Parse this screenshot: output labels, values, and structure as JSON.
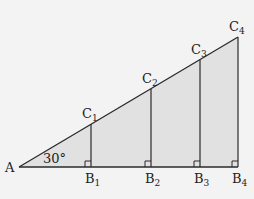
{
  "diagram": {
    "angle_label": "30°",
    "colors": {
      "background": "#f3f3f3",
      "fill": "#e1e1e1",
      "stroke": "#2a2a2a"
    },
    "vertex_A": {
      "label": "A",
      "x": 19,
      "y": 167
    },
    "base_y": 167,
    "points": [
      {
        "B_label": "B",
        "B_sub": "1",
        "C_label": "C",
        "C_sub": "1",
        "x": 91,
        "cy": 124
      },
      {
        "B_label": "B",
        "B_sub": "2",
        "C_label": "C",
        "C_sub": "2",
        "x": 151,
        "cy": 89
      },
      {
        "B_label": "B",
        "B_sub": "3",
        "C_label": "C",
        "C_sub": "3",
        "x": 200,
        "cy": 60
      },
      {
        "B_label": "B",
        "B_sub": "4",
        "C_label": "C",
        "C_sub": "4",
        "x": 238,
        "cy": 37
      }
    ]
  }
}
